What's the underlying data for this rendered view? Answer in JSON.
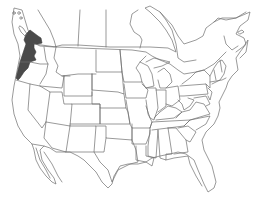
{
  "map": {
    "type": "range-map",
    "region": "North America (USA and southern Canada)",
    "background_color": "#ffffff",
    "border_color": "#6e6e6e",
    "highlight_color": "#4a4a4a",
    "highlighted_regions": [
      "Southwestern British Columbia",
      "Western Washington",
      "Western Oregon",
      "Northwestern California coast"
    ]
  }
}
